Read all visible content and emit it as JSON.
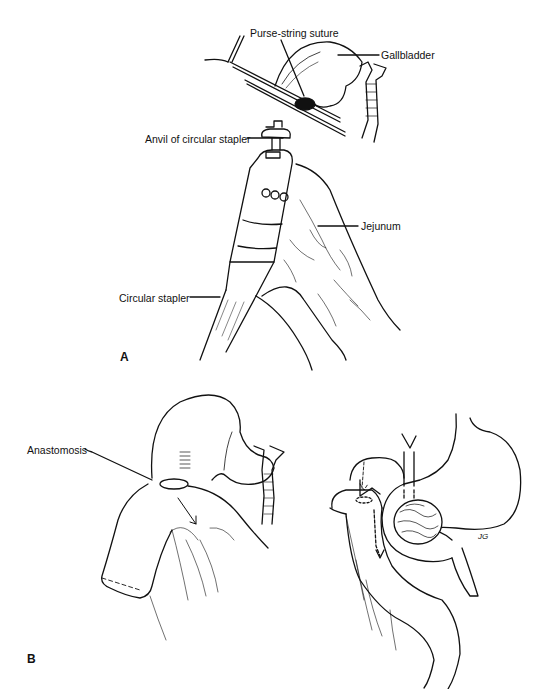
{
  "figure": {
    "panel_a": {
      "letter": "A",
      "labels": {
        "purse_string": "Purse-string suture",
        "gallbladder": "Gallbladder",
        "anvil": "Anvil of circular stapler",
        "jejunum": "Jejunum",
        "circular_stapler": "Circular stapler"
      }
    },
    "panel_b": {
      "letter": "B",
      "labels": {
        "anastomosis": "Anastomosis"
      },
      "artist_initials": "JG"
    }
  }
}
